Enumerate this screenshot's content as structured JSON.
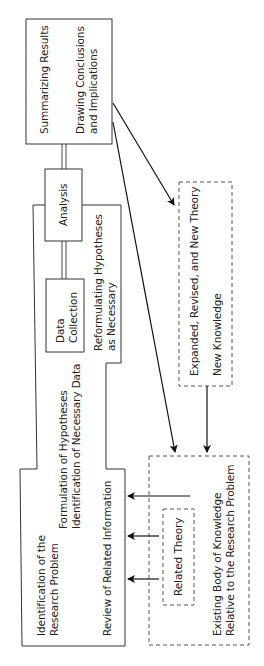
{
  "diagram": {
    "orientation": "rotated-90-ccw",
    "nodes": {
      "summarizing": {
        "line1": "Summarizing Results",
        "line2": "Drawing Conclusions",
        "line3": "and Implications"
      },
      "analysis": {
        "label": "Analysis"
      },
      "data_collection": {
        "line1": "Data",
        "line2": "Collection"
      },
      "reformulating": {
        "line1": "Reformulating Hypotheses",
        "line2": "as Necessary"
      },
      "formulation": {
        "line1": "Formulation of Hypotheses",
        "line2": "Identification of Necessary Data"
      },
      "identification": {
        "line1": "Identification of the",
        "line2": "Research Problem"
      },
      "review": {
        "label": "Review of Related Information"
      },
      "expanded_theory": {
        "line1": "Expanded, Revised, and New Theory",
        "line2": "New Knowledge"
      },
      "existing_body": {
        "line1": "Existing Body of Knowledge",
        "line2": "Relative to the Research Problem"
      },
      "related_theory": {
        "label": "Related Theory"
      }
    },
    "edges": [
      {
        "from": "summarizing",
        "to": "analysis",
        "style": "double-line"
      },
      {
        "from": "analysis",
        "to": "data_collection",
        "style": "double-line"
      },
      {
        "from": "summarizing",
        "to": "expanded_theory",
        "style": "arrow"
      },
      {
        "from": "summarizing",
        "to": "existing_body",
        "style": "arrow"
      },
      {
        "from": "expanded_theory",
        "to": "existing_body",
        "style": "arrow"
      },
      {
        "from": "existing_body",
        "to": "review",
        "style": "arrow"
      },
      {
        "from": "related_theory",
        "to": "review",
        "style": "arrow",
        "count": 2
      }
    ]
  }
}
